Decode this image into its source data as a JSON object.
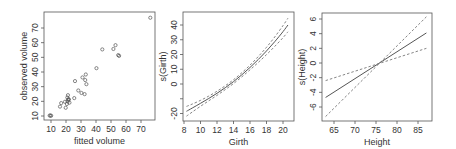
{
  "chart_data": [
    {
      "type": "scatter",
      "title": "",
      "xlabel": "fitted volume",
      "ylabel": "observed volume",
      "xlim": [
        5.5,
        78
      ],
      "ylim": [
        7.5,
        80
      ],
      "xticks": [
        10,
        20,
        30,
        40,
        50,
        60,
        70
      ],
      "yticks": [
        10,
        20,
        30,
        40,
        50,
        60,
        70
      ],
      "grid": false,
      "points": [
        [
          9.1,
          10.3
        ],
        [
          9.6,
          10.3
        ],
        [
          10.1,
          10.2
        ],
        [
          16.0,
          16.4
        ],
        [
          16.8,
          18.8
        ],
        [
          19.3,
          19.7
        ],
        [
          19.8,
          15.6
        ],
        [
          20.6,
          18.2
        ],
        [
          20.9,
          22.6
        ],
        [
          21.1,
          19.9
        ],
        [
          21.3,
          24.2
        ],
        [
          21.5,
          21.0
        ],
        [
          21.6,
          21.4
        ],
        [
          21.9,
          21.3
        ],
        [
          22.3,
          19.1
        ],
        [
          25.5,
          22.2
        ],
        [
          26.0,
          33.8
        ],
        [
          28.2,
          27.4
        ],
        [
          30.3,
          25.7
        ],
        [
          32.4,
          24.9
        ],
        [
          32.8,
          34.5
        ],
        [
          33.6,
          31.7
        ],
        [
          31.0,
          36.3
        ],
        [
          33.2,
          38.3
        ],
        [
          40.3,
          42.6
        ],
        [
          44.2,
          55.4
        ],
        [
          51.6,
          55.7
        ],
        [
          53.0,
          58.3
        ],
        [
          54.8,
          51.5
        ],
        [
          55.4,
          51.0
        ],
        [
          76.2,
          77.0
        ]
      ]
    },
    {
      "type": "line",
      "title": "",
      "xlabel": "Girth",
      "ylabel": "s(Girth)",
      "xlim": [
        8,
        21
      ],
      "ylim": [
        -25,
        46
      ],
      "xticks": [
        8,
        10,
        12,
        14,
        16,
        18,
        20
      ],
      "yticks": [
        -20,
        -10,
        0,
        10,
        20,
        30,
        40
      ],
      "ytick_labels": [
        "-20",
        "",
        "0",
        "10",
        "20",
        "30",
        "40"
      ],
      "grid": false,
      "x": [
        8.3,
        9,
        10,
        11,
        12,
        13,
        14,
        15,
        16,
        17,
        18,
        19,
        20,
        20.6
      ],
      "series": [
        {
          "name": "fit",
          "style": "solid",
          "values": [
            -18.5,
            -16.3,
            -13.1,
            -9.8,
            -6.3,
            -2.5,
            1.6,
            6.2,
            11.2,
            16.6,
            22.4,
            28.7,
            35.5,
            40.0
          ]
        },
        {
          "name": "upper",
          "style": "dashed",
          "values": [
            -15.2,
            -13.6,
            -11.1,
            -8.2,
            -4.9,
            -1.2,
            2.9,
            7.6,
            12.8,
            18.6,
            24.9,
            31.9,
            39.6,
            44.6
          ]
        },
        {
          "name": "lower",
          "style": "dashed",
          "values": [
            -21.8,
            -19.0,
            -15.1,
            -11.4,
            -7.7,
            -3.8,
            0.3,
            4.8,
            9.6,
            14.6,
            19.9,
            25.5,
            31.4,
            35.4
          ]
        }
      ]
    },
    {
      "type": "line",
      "title": "",
      "xlabel": "Height",
      "ylabel": "s(Height)",
      "xlim": [
        62,
        88
      ],
      "ylim": [
        -8,
        6.8
      ],
      "xticks": [
        65,
        70,
        75,
        80,
        85
      ],
      "yticks": [
        -6,
        -4,
        -2,
        0,
        2,
        4,
        6
      ],
      "grid": false,
      "x": [
        63,
        87
      ],
      "series": [
        {
          "name": "fit",
          "style": "solid",
          "values": [
            -4.7,
            4.1
          ]
        },
        {
          "name": "upper",
          "style": "dashed",
          "values": [
            -2.4,
            2.0
          ]
        },
        {
          "name": "lower",
          "style": "dashed",
          "values": [
            -7.3,
            6.3
          ]
        }
      ]
    }
  ]
}
